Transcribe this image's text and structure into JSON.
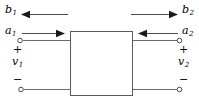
{
  "figure": {
    "background_color": "#ffffff",
    "line_color": "#4a4a4a",
    "text_color": "#000000",
    "box": {
      "label": "",
      "x": 70,
      "y": 31,
      "width": 63,
      "height": 65
    },
    "wave_labels": {
      "b1": "b",
      "b1_sub": "1",
      "b2": "b",
      "b2_sub": "2",
      "a1": "a",
      "a1_sub": "1",
      "a2": "a",
      "a2_sub": "2"
    },
    "voltage_labels": {
      "v1": "v",
      "v1_sub": "1",
      "v2": "v",
      "v2_sub": "2"
    },
    "polarity": {
      "plus_left": "+",
      "minus_left": "−",
      "plus_right": "+",
      "minus_right": "−"
    },
    "arrows": {
      "b1_direction": "left",
      "b2_direction": "right",
      "a1_direction": "right",
      "a2_direction": "left"
    },
    "terminals": {
      "count": 4,
      "style": "open-circle"
    }
  }
}
